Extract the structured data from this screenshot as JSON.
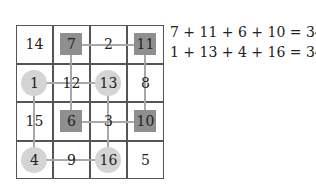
{
  "grid": {
    "rows": [
      [
        "14",
        "7",
        "2",
        "11"
      ],
      [
        "1",
        "12",
        "13",
        "8"
      ],
      [
        "15",
        "6",
        "3",
        "10"
      ],
      [
        "4",
        "9",
        "16",
        "5"
      ]
    ],
    "squares": [
      [
        0,
        1
      ],
      [
        0,
        3
      ],
      [
        2,
        1
      ],
      [
        2,
        3
      ]
    ],
    "circles": [
      [
        1,
        0
      ],
      [
        1,
        2
      ],
      [
        3,
        0
      ],
      [
        3,
        2
      ]
    ]
  },
  "equations": [
    "7 + 11 + 6 + 10 = 34",
    "1 + 13 + 4 + 16 = 34"
  ]
}
